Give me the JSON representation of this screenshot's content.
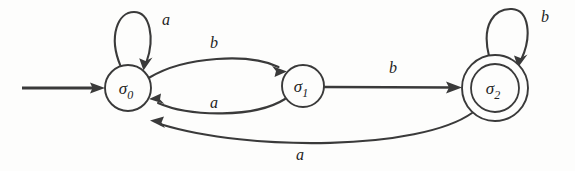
{
  "diagram": {
    "kind": "finite-state-automaton",
    "background_color": "#fdfdfc",
    "stroke_color": "#3a3a3a",
    "text_color": "#232323",
    "alphabet": [
      "a",
      "b"
    ],
    "start_state": "sigma-0",
    "accepting_states": [
      "sigma-2"
    ],
    "states": [
      {
        "id": "sigma-0",
        "symbol": "σ",
        "subscript": "0",
        "cx": 128,
        "cy": 88,
        "r": 23,
        "accepting": false,
        "is_start": true
      },
      {
        "id": "sigma-1",
        "symbol": "σ",
        "subscript": "1",
        "cx": 303,
        "cy": 86,
        "r": 21,
        "accepting": false,
        "is_start": false
      },
      {
        "id": "sigma-2",
        "symbol": "σ",
        "subscript": "2",
        "cx": 495,
        "cy": 88,
        "r": 33,
        "r_inner": 24,
        "accepting": true,
        "is_start": false
      }
    ],
    "transitions": [
      {
        "id": "t-s0-s0-a",
        "from": "sigma-0",
        "to": "sigma-0",
        "label": "a",
        "kind": "self-loop",
        "label_x": 166,
        "label_y": 25
      },
      {
        "id": "t-s0-s1-b",
        "from": "sigma-0",
        "to": "sigma-1",
        "label": "b",
        "kind": "arc-top",
        "label_x": 214,
        "label_y": 48
      },
      {
        "id": "t-s1-s0-a",
        "from": "sigma-1",
        "to": "sigma-0",
        "label": "a",
        "kind": "arc-bottom",
        "label_x": 214,
        "label_y": 108
      },
      {
        "id": "t-s1-s2-b",
        "from": "sigma-1",
        "to": "sigma-2",
        "label": "b",
        "kind": "straight",
        "label_x": 393,
        "label_y": 73
      },
      {
        "id": "t-s2-s2-b",
        "from": "sigma-2",
        "to": "sigma-2",
        "label": "b",
        "kind": "self-loop",
        "label_x": 545,
        "label_y": 22
      },
      {
        "id": "t-s2-s0-a",
        "from": "sigma-2",
        "to": "sigma-0",
        "label": "a",
        "kind": "arc-long-bottom",
        "label_x": 300,
        "label_y": 160
      }
    ],
    "start_arrow": {
      "id": "start-arrow",
      "x_from": 22,
      "x_to": 103,
      "y": 88
    }
  }
}
